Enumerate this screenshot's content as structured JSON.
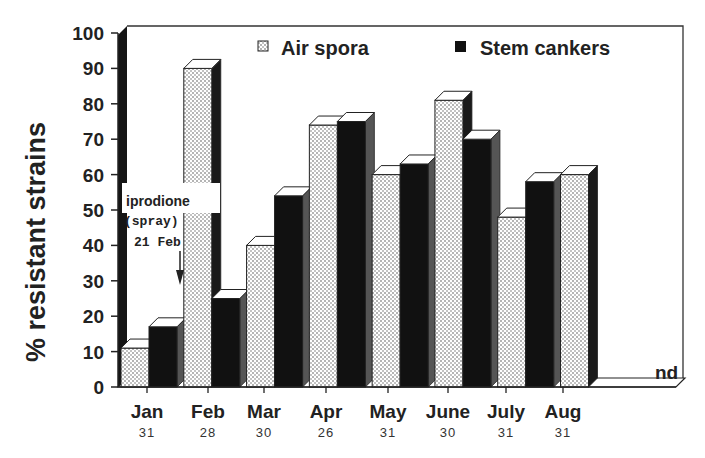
{
  "chart_data": {
    "type": "bar",
    "title": "",
    "xlabel": "",
    "ylabel": "% resistant strains",
    "ylim": [
      0,
      100
    ],
    "yticks": [
      0,
      10,
      20,
      30,
      40,
      50,
      60,
      70,
      80,
      90,
      100
    ],
    "categories": [
      "Jan",
      "Feb",
      "Mar",
      "Apr",
      "May",
      "June",
      "July",
      "Aug"
    ],
    "sample_counts": [
      "31",
      "28",
      "30",
      "26",
      "31",
      "30",
      "31",
      "31"
    ],
    "series": [
      {
        "name": "Air spora",
        "pattern": "dotted",
        "values": [
          11,
          90,
          40,
          74,
          60,
          81,
          48,
          60
        ]
      },
      {
        "name": "Stem cankers",
        "pattern": "solid-black",
        "values": [
          17,
          25,
          54,
          75,
          63,
          70,
          58,
          null
        ]
      }
    ],
    "legend_position": "top",
    "grid": false,
    "style": "3d-bar",
    "annotations": [
      {
        "text_lines": [
          "iprodione",
          "(spray)",
          "21 Feb"
        ],
        "arrow": "down",
        "x_between": [
          "Jan",
          "Feb"
        ]
      },
      {
        "text": "nd",
        "category": "Aug",
        "series": "Stem cankers"
      }
    ]
  },
  "legend": {
    "air_spora": "Air spora",
    "stem_cankers": "Stem cankers"
  },
  "annotation": {
    "line1": "iprodione",
    "line2": "(spray)",
    "line3": "21 Feb",
    "nd": "nd"
  },
  "axis": {
    "ylabel": "% resistant strains"
  }
}
